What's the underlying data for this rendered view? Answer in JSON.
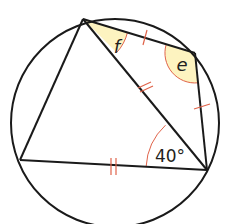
{
  "diagram": {
    "type": "cyclic-quadrilateral",
    "colors": {
      "line": "#1a1a1a",
      "marks": "#e0634a",
      "highlight": "#fdf3c0"
    },
    "labels": {
      "angle_f": "f",
      "angle_e": "e",
      "angle_c": "40°"
    },
    "vertices": {
      "A": [
        83,
        19
      ],
      "B": [
        195,
        53
      ],
      "C": [
        207,
        170
      ],
      "D": [
        20,
        160
      ]
    },
    "circle": {
      "cx": 115,
      "cy": 123,
      "r": 104
    }
  }
}
